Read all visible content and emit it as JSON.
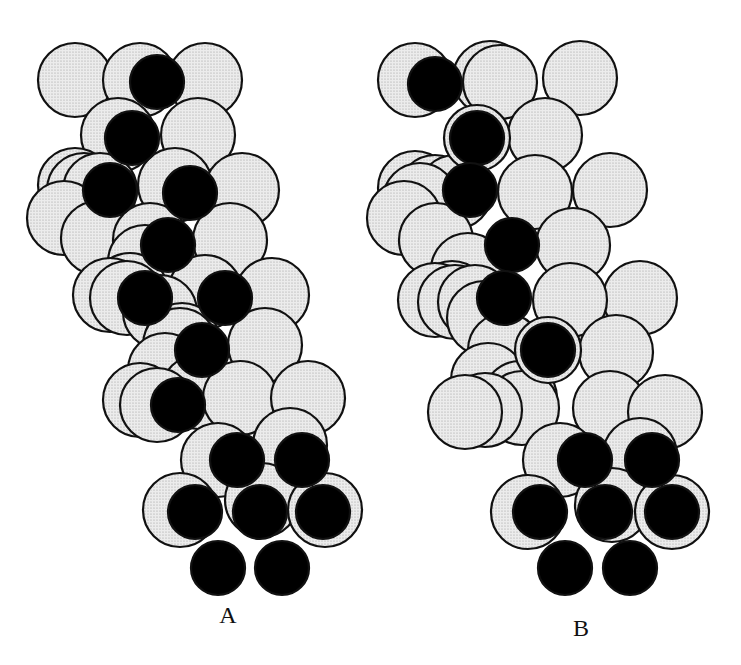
{
  "figure": {
    "type": "space-filling molecular model comparison",
    "colors": {
      "light_atom_fill": "#e9e9e9",
      "stipple_dot": "#9a9a9a",
      "dark_atom_fill": "#000000",
      "outline": "#111111",
      "background": "#ffffff"
    },
    "atom_radius_light": 37,
    "atom_radius_dark": 27,
    "panels": [
      {
        "id": "A",
        "label": "A",
        "label_pos": [
          228,
          622
        ],
        "atoms": [
          {
            "x": 64,
            "y": 218,
            "kind": "light"
          },
          {
            "x": 84,
            "y": 190,
            "kind": "light"
          },
          {
            "x": 98,
            "y": 238,
            "kind": "light"
          },
          {
            "x": 130,
            "y": 290,
            "kind": "light"
          },
          {
            "x": 145,
            "y": 262,
            "kind": "light"
          },
          {
            "x": 160,
            "y": 312,
            "kind": "light"
          },
          {
            "x": 165,
            "y": 370,
            "kind": "light"
          },
          {
            "x": 182,
            "y": 340,
            "kind": "light"
          },
          {
            "x": 198,
            "y": 392,
            "kind": "light"
          },
          {
            "x": 75,
            "y": 80,
            "kind": "light"
          },
          {
            "x": 140,
            "y": 80,
            "kind": "light"
          },
          {
            "x": 205,
            "y": 80,
            "kind": "light"
          },
          {
            "x": 75,
            "y": 185,
            "kind": "light"
          },
          {
            "x": 100,
            "y": 190,
            "kind": "light"
          },
          {
            "x": 118,
            "y": 135,
            "kind": "light"
          },
          {
            "x": 198,
            "y": 135,
            "kind": "light"
          },
          {
            "x": 175,
            "y": 185,
            "kind": "light"
          },
          {
            "x": 242,
            "y": 190,
            "kind": "light"
          },
          {
            "x": 150,
            "y": 240,
            "kind": "light"
          },
          {
            "x": 230,
            "y": 240,
            "kind": "light"
          },
          {
            "x": 110,
            "y": 295,
            "kind": "light"
          },
          {
            "x": 127,
            "y": 298,
            "kind": "light"
          },
          {
            "x": 205,
            "y": 292,
            "kind": "light"
          },
          {
            "x": 272,
            "y": 295,
            "kind": "light"
          },
          {
            "x": 180,
            "y": 345,
            "kind": "light"
          },
          {
            "x": 265,
            "y": 345,
            "kind": "light"
          },
          {
            "x": 140,
            "y": 400,
            "kind": "light"
          },
          {
            "x": 157,
            "y": 405,
            "kind": "light"
          },
          {
            "x": 240,
            "y": 398,
            "kind": "light"
          },
          {
            "x": 308,
            "y": 398,
            "kind": "light"
          },
          {
            "x": 218,
            "y": 460,
            "kind": "light"
          },
          {
            "x": 290,
            "y": 445,
            "kind": "light"
          },
          {
            "x": 180,
            "y": 510,
            "kind": "light"
          },
          {
            "x": 262,
            "y": 500,
            "kind": "light"
          },
          {
            "x": 325,
            "y": 510,
            "kind": "light"
          },
          {
            "x": 157,
            "y": 82,
            "kind": "dark"
          },
          {
            "x": 132,
            "y": 138,
            "kind": "dark"
          },
          {
            "x": 110,
            "y": 190,
            "kind": "dark"
          },
          {
            "x": 190,
            "y": 193,
            "kind": "dark"
          },
          {
            "x": 168,
            "y": 245,
            "kind": "dark"
          },
          {
            "x": 145,
            "y": 298,
            "kind": "dark"
          },
          {
            "x": 225,
            "y": 298,
            "kind": "dark"
          },
          {
            "x": 202,
            "y": 350,
            "kind": "dark"
          },
          {
            "x": 178,
            "y": 405,
            "kind": "dark"
          },
          {
            "x": 237,
            "y": 460,
            "kind": "dark"
          },
          {
            "x": 302,
            "y": 460,
            "kind": "dark"
          },
          {
            "x": 195,
            "y": 512,
            "kind": "dark"
          },
          {
            "x": 260,
            "y": 512,
            "kind": "dark"
          },
          {
            "x": 323,
            "y": 512,
            "kind": "dark"
          },
          {
            "x": 218,
            "y": 568,
            "kind": "dark"
          },
          {
            "x": 282,
            "y": 568,
            "kind": "dark"
          }
        ]
      },
      {
        "id": "B",
        "label": "B",
        "label_pos": [
          581,
          635
        ],
        "atoms": [
          {
            "x": 404,
            "y": 218,
            "kind": "light"
          },
          {
            "x": 420,
            "y": 200,
            "kind": "light"
          },
          {
            "x": 436,
            "y": 240,
            "kind": "light"
          },
          {
            "x": 452,
            "y": 298,
            "kind": "light"
          },
          {
            "x": 468,
            "y": 270,
            "kind": "light"
          },
          {
            "x": 484,
            "y": 318,
            "kind": "light"
          },
          {
            "x": 488,
            "y": 380,
            "kind": "light"
          },
          {
            "x": 505,
            "y": 350,
            "kind": "light"
          },
          {
            "x": 520,
            "y": 398,
            "kind": "light"
          },
          {
            "x": 415,
            "y": 80,
            "kind": "light"
          },
          {
            "x": 490,
            "y": 78,
            "kind": "light"
          },
          {
            "x": 580,
            "y": 78,
            "kind": "light"
          },
          {
            "x": 415,
            "y": 188,
            "kind": "light"
          },
          {
            "x": 435,
            "y": 192,
            "kind": "light"
          },
          {
            "x": 455,
            "y": 192,
            "kind": "light"
          },
          {
            "x": 500,
            "y": 82,
            "kind": "light"
          },
          {
            "x": 545,
            "y": 135,
            "kind": "light"
          },
          {
            "x": 535,
            "y": 192,
            "kind": "light"
          },
          {
            "x": 610,
            "y": 190,
            "kind": "light"
          },
          {
            "x": 573,
            "y": 245,
            "kind": "light"
          },
          {
            "x": 435,
            "y": 300,
            "kind": "light"
          },
          {
            "x": 455,
            "y": 302,
            "kind": "light"
          },
          {
            "x": 475,
            "y": 302,
            "kind": "light"
          },
          {
            "x": 570,
            "y": 300,
            "kind": "light"
          },
          {
            "x": 640,
            "y": 298,
            "kind": "light"
          },
          {
            "x": 616,
            "y": 352,
            "kind": "light"
          },
          {
            "x": 465,
            "y": 412,
            "kind": "light"
          },
          {
            "x": 485,
            "y": 410,
            "kind": "light"
          },
          {
            "x": 522,
            "y": 408,
            "kind": "light"
          },
          {
            "x": 610,
            "y": 408,
            "kind": "light"
          },
          {
            "x": 665,
            "y": 412,
            "kind": "light"
          },
          {
            "x": 560,
            "y": 460,
            "kind": "light"
          },
          {
            "x": 640,
            "y": 455,
            "kind": "light"
          },
          {
            "x": 528,
            "y": 512,
            "kind": "light"
          },
          {
            "x": 612,
            "y": 505,
            "kind": "light"
          },
          {
            "x": 672,
            "y": 512,
            "kind": "light"
          },
          {
            "x": 435,
            "y": 84,
            "kind": "dark"
          },
          {
            "x": 477,
            "y": 138,
            "kind": "dark",
            "ring": true
          },
          {
            "x": 470,
            "y": 190,
            "kind": "dark"
          },
          {
            "x": 512,
            "y": 245,
            "kind": "dark"
          },
          {
            "x": 504,
            "y": 298,
            "kind": "dark"
          },
          {
            "x": 548,
            "y": 350,
            "kind": "dark",
            "ring": true
          },
          {
            "x": 585,
            "y": 460,
            "kind": "dark"
          },
          {
            "x": 652,
            "y": 460,
            "kind": "dark"
          },
          {
            "x": 540,
            "y": 512,
            "kind": "dark"
          },
          {
            "x": 605,
            "y": 512,
            "kind": "dark"
          },
          {
            "x": 672,
            "y": 512,
            "kind": "dark"
          },
          {
            "x": 565,
            "y": 568,
            "kind": "dark"
          },
          {
            "x": 630,
            "y": 568,
            "kind": "dark"
          }
        ]
      }
    ]
  }
}
